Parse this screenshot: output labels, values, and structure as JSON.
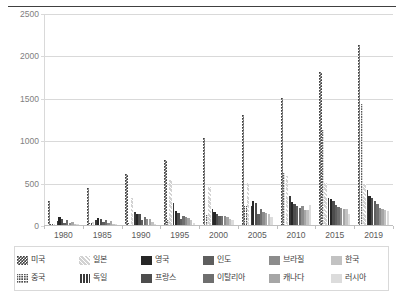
{
  "chart_data": {
    "type": "bar",
    "title": "",
    "xlabel": "",
    "ylabel": "",
    "ylim": [
      0,
      2500
    ],
    "ytick_labels": [
      "0",
      "500",
      "1000",
      "1500",
      "2000",
      "2500"
    ],
    "ytick_values": [
      0,
      500,
      1000,
      1500,
      2000,
      2500
    ],
    "grid": true,
    "legend_position": "bottom",
    "categories": [
      "1980",
      "1985",
      "1990",
      "1995",
      "2000",
      "2005",
      "2010",
      "2015",
      "2019"
    ],
    "series": [
      {
        "name": "미국",
        "key": "usa",
        "pattern": "checker-dark",
        "values": [
          288,
          434,
          605,
          766,
          1027,
          1302,
          1494,
          1800,
          2127
        ]
      },
      {
        "name": "중국",
        "key": "china",
        "pattern": "dotted-dark",
        "values": [
          12,
          19,
          25,
          55,
          120,
          225,
          610,
          1120,
          1425
        ]
      },
      {
        "name": "일본",
        "key": "japan",
        "pattern": "diagonal-light",
        "values": [
          16,
          31,
          320,
          530,
          445,
          490,
          580,
          490,
          480
        ]
      },
      {
        "name": "독일",
        "key": "germany",
        "pattern": "vertical-dark",
        "values": [
          48,
          65,
          150,
          255,
          185,
          225,
          340,
          320,
          410
        ]
      },
      {
        "name": "영국",
        "key": "uk",
        "pattern": "solid-darkest",
        "values": [
          95,
          88,
          135,
          165,
          155,
          285,
          270,
          305,
          345
        ]
      },
      {
        "name": "프랑스",
        "key": "france",
        "pattern": "solid-dark",
        "values": [
          76,
          70,
          125,
          145,
          135,
          255,
          250,
          280,
          320
        ]
      },
      {
        "name": "인도",
        "key": "india",
        "pattern": "solid-medium-dark",
        "values": [
          25,
          38,
          55,
          75,
          105,
          135,
          230,
          240,
          285
        ]
      },
      {
        "name": "이탈리아",
        "key": "italy",
        "pattern": "solid-medium",
        "values": [
          60,
          55,
          100,
          110,
          105,
          185,
          200,
          215,
          245
        ]
      },
      {
        "name": "브라질",
        "key": "brazil",
        "pattern": "solid-mid-light",
        "values": [
          18,
          22,
          70,
          90,
          110,
          150,
          230,
          195,
          200
        ]
      },
      {
        "name": "캐나다",
        "key": "canada",
        "pattern": "solid-light",
        "values": [
          35,
          45,
          75,
          85,
          95,
          145,
          180,
          190,
          185
        ]
      },
      {
        "name": "한국",
        "key": "korea",
        "pattern": "solid-lighter",
        "values": [
          8,
          12,
          35,
          60,
          75,
          130,
          175,
          185,
          180
        ]
      },
      {
        "name": "러시아",
        "key": "russia",
        "pattern": "solid-lightest",
        "values": [
          5,
          6,
          15,
          20,
          60,
          95,
          240,
          135,
          170
        ]
      }
    ],
    "legend_entries": [
      {
        "label": "미국",
        "swatch": "checker-dark"
      },
      {
        "label": "일본",
        "swatch": "diagonal-light"
      },
      {
        "label": "영국",
        "swatch": "solid-darkest"
      },
      {
        "label": "인도",
        "swatch": "solid-medium-dark"
      },
      {
        "label": "브라질",
        "swatch": "solid-mid-light"
      },
      {
        "label": "한국",
        "swatch": "solid-lighter"
      },
      {
        "label": "중국",
        "swatch": "dotted-dark"
      },
      {
        "label": "독일",
        "swatch": "vertical-dark"
      },
      {
        "label": "프랑스",
        "swatch": "solid-dark"
      },
      {
        "label": "이탈리아",
        "swatch": "solid-medium"
      },
      {
        "label": "캐나다",
        "swatch": "solid-light"
      },
      {
        "label": "러시아",
        "swatch": "solid-lightest"
      }
    ],
    "colors": {
      "usa": "#3f3f3f",
      "china": "#4a4a4a",
      "japan": "#d2d2d2",
      "germany": "#3a3a3a",
      "uk": "#262626",
      "france": "#4d4d4d",
      "india": "#5e5e5e",
      "italy": "#6e6e6e",
      "brazil": "#8c8c8c",
      "canada": "#a6a6a6",
      "korea": "#c2c2c2",
      "russia": "#dcdcdc",
      "grid": "#d9d9d9",
      "axis_text": "#808080",
      "tick_text": "#595959",
      "top_rule": "#404040",
      "legend_border": "#d9d9d9"
    }
  }
}
